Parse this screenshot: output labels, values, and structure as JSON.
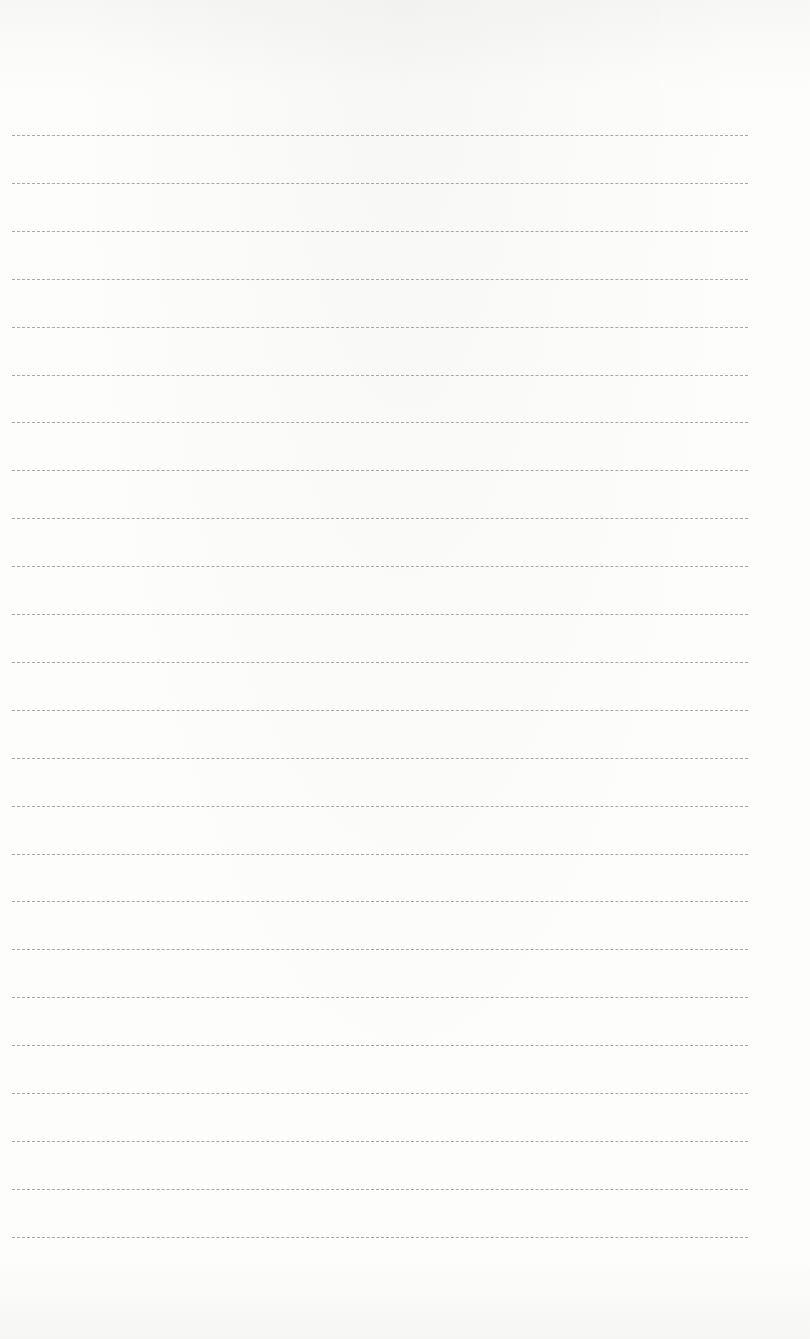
{
  "page": {
    "type": "ruled-paper",
    "background_color": "#fcfcfb",
    "line_color": "#9a9a9a",
    "line_style": "dashed",
    "line_count": 24,
    "first_line_y": 135,
    "line_spacing": 47.9,
    "line_left": 12,
    "line_width": 736,
    "lines": [
      {
        "text": ""
      },
      {
        "text": ""
      },
      {
        "text": ""
      },
      {
        "text": ""
      },
      {
        "text": ""
      },
      {
        "text": ""
      },
      {
        "text": ""
      },
      {
        "text": ""
      },
      {
        "text": ""
      },
      {
        "text": ""
      },
      {
        "text": ""
      },
      {
        "text": ""
      },
      {
        "text": ""
      },
      {
        "text": ""
      },
      {
        "text": ""
      },
      {
        "text": ""
      },
      {
        "text": ""
      },
      {
        "text": ""
      },
      {
        "text": ""
      },
      {
        "text": ""
      },
      {
        "text": ""
      },
      {
        "text": ""
      },
      {
        "text": ""
      },
      {
        "text": ""
      }
    ]
  }
}
